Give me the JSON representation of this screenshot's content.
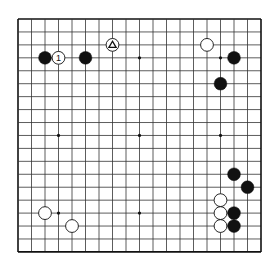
{
  "board": {
    "size": 19,
    "origin_x": 18,
    "origin_y": 19,
    "spacing_x": 13.5,
    "spacing_y": 12.94,
    "line_color": "#333333",
    "border_color": "#111111",
    "star_points": [
      [
        3,
        3
      ],
      [
        9,
        3
      ],
      [
        15,
        3
      ],
      [
        3,
        9
      ],
      [
        9,
        9
      ],
      [
        15,
        9
      ],
      [
        3,
        15
      ],
      [
        9,
        15
      ],
      [
        15,
        15
      ]
    ]
  },
  "stones": [
    {
      "color": "black",
      "col": 2,
      "row": 3
    },
    {
      "color": "white",
      "col": 3,
      "row": 3,
      "label": "1"
    },
    {
      "color": "black",
      "col": 5,
      "row": 3
    },
    {
      "color": "white",
      "col": 7,
      "row": 2,
      "marker": "triangle"
    },
    {
      "color": "white",
      "col": 14,
      "row": 2
    },
    {
      "color": "black",
      "col": 16,
      "row": 3
    },
    {
      "color": "black",
      "col": 15,
      "row": 5
    },
    {
      "color": "black",
      "col": 16,
      "row": 12
    },
    {
      "color": "black",
      "col": 17,
      "row": 13
    },
    {
      "color": "white",
      "col": 15,
      "row": 14
    },
    {
      "color": "white",
      "col": 15,
      "row": 15
    },
    {
      "color": "black",
      "col": 16,
      "row": 15
    },
    {
      "color": "white",
      "col": 15,
      "row": 16
    },
    {
      "color": "black",
      "col": 16,
      "row": 16
    },
    {
      "color": "white",
      "col": 2,
      "row": 15
    },
    {
      "color": "white",
      "col": 4,
      "row": 16
    }
  ]
}
